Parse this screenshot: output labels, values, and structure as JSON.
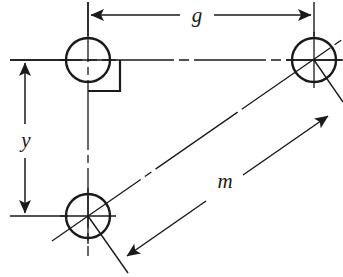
{
  "diagram": {
    "type": "engineering-drawing",
    "canvas": {
      "width": 343,
      "height": 277
    },
    "colors": {
      "line": "#1a1a1a",
      "background": "#ffffff"
    },
    "holes": [
      {
        "id": "hole-top-left",
        "cx": 88,
        "cy": 60,
        "r": 22
      },
      {
        "id": "hole-top-right",
        "cx": 314,
        "cy": 60,
        "r": 22
      },
      {
        "id": "hole-bottom-left",
        "cx": 88,
        "cy": 216,
        "r": 22
      }
    ],
    "dimensions": [
      {
        "id": "dim-g",
        "label": "g",
        "orientation": "horizontal",
        "label_x": 197,
        "label_y": 16,
        "from": {
          "x": 88,
          "y": 15
        },
        "to": {
          "x": 314,
          "y": 15
        }
      },
      {
        "id": "dim-y",
        "label": "y",
        "orientation": "vertical",
        "label_x": 26,
        "label_y": 142,
        "from": {
          "x": 25,
          "y": 60
        },
        "to": {
          "x": 25,
          "y": 216
        }
      },
      {
        "id": "dim-m",
        "label": "m",
        "orientation": "diagonal",
        "label_x": 226,
        "label_y": 182,
        "from": {
          "x": 125,
          "y": 258
        },
        "to": {
          "x": 330,
          "y": 115
        }
      }
    ],
    "annotations": [
      {
        "id": "right-angle-marker",
        "label": "",
        "x": 88,
        "y": 60
      }
    ]
  }
}
